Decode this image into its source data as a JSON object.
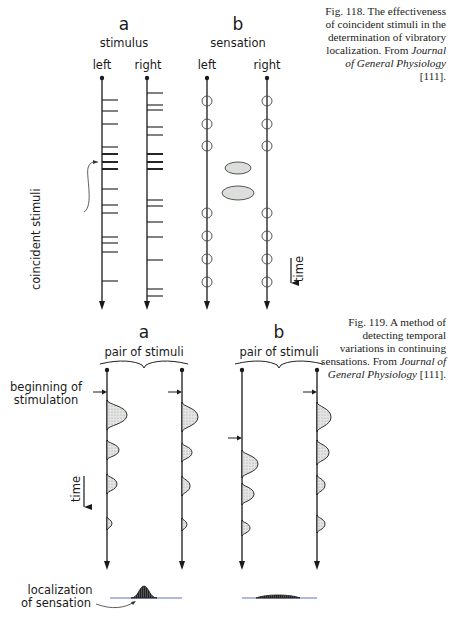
{
  "fig118": {
    "caption": {
      "prefix": "Fig. 118. The effectiveness of coincident stimuli in the determination of vibratory localization. From ",
      "journal": "Journal of General Physiology",
      "ref": " [111]."
    },
    "panel_a": {
      "letter": "a",
      "title": "stimulus",
      "left_label": "left",
      "right_label": "right",
      "annotation": "coincident stimuli",
      "left_line_x": 102,
      "right_line_x": 147,
      "line_top": 78,
      "line_bottom": 310,
      "left_ticks": [
        100,
        111,
        124,
        147,
        154,
        162,
        169,
        189,
        205,
        213,
        237,
        243,
        252,
        281
      ],
      "right_ticks": [
        93,
        105,
        110,
        127,
        135,
        154,
        162,
        169,
        200,
        206,
        222,
        237,
        260,
        289,
        296
      ],
      "bold_ticks": [
        154,
        162,
        169
      ]
    },
    "panel_b": {
      "letter": "b",
      "title": "sensation",
      "left_label": "left",
      "right_label": "right",
      "time_label": "time",
      "left_line_x": 207,
      "right_line_x": 267,
      "line_top": 78,
      "line_bottom": 310,
      "left_circles": [
        101,
        124,
        146,
        213,
        236,
        259,
        282
      ],
      "right_circles": [
        101,
        124,
        146,
        213,
        236,
        259,
        282
      ],
      "ellipses": [
        {
          "cx": 238,
          "cy": 168,
          "rx": 13,
          "ry": 6
        },
        {
          "cx": 238,
          "cy": 193,
          "rx": 16,
          "ry": 7
        }
      ]
    }
  },
  "fig119": {
    "caption": {
      "prefix": "Fig. 119. A method of detecting temporal variations in continuing sensations. From ",
      "journal": "Journal of General Physiology",
      "ref": " [111]."
    },
    "panel_a": {
      "letter": "a",
      "title": "pair of stimuli",
      "start_label_1": "beginning of",
      "start_label_2": "stimulation",
      "time_label": "time",
      "result_label_1": "localization",
      "result_label_2": "of sensation",
      "left_line_x": 107,
      "right_line_x": 182,
      "line_top": 370,
      "line_bottom": 570,
      "left_arrow_y": 392,
      "right_arrow_y": 392,
      "left_humps": [
        [
          400,
          430,
          20
        ],
        [
          440,
          460,
          12
        ],
        [
          474,
          494,
          10
        ],
        [
          517,
          530,
          5
        ]
      ],
      "right_humps": [
        [
          402,
          432,
          16
        ],
        [
          443,
          462,
          10
        ],
        [
          476,
          496,
          8
        ],
        [
          518,
          531,
          5
        ]
      ],
      "result": {
        "x1": 110,
        "x2": 182,
        "y": 598,
        "peak_x": 144,
        "peak_h": 12,
        "width": 26
      }
    },
    "panel_b": {
      "letter": "b",
      "title": "pair of stimuli",
      "left_line_x": 242,
      "right_line_x": 317,
      "line_top": 370,
      "line_bottom": 570,
      "left_arrow_y": 438,
      "right_arrow_y": 392,
      "left_humps": [
        [
          450,
          478,
          16
        ],
        [
          483,
          505,
          12
        ],
        [
          520,
          536,
          8
        ]
      ],
      "right_humps": [
        [
          402,
          432,
          14
        ],
        [
          440,
          465,
          12
        ],
        [
          475,
          495,
          8
        ],
        [
          515,
          533,
          8
        ]
      ],
      "result": {
        "x1": 242,
        "x2": 317,
        "y": 598,
        "peak_x": 278,
        "peak_h": 4,
        "width": 44
      }
    }
  },
  "colors": {
    "ink": "#1a1a1a",
    "fill": "#d9dcd9",
    "baseline": "#5060c0"
  }
}
